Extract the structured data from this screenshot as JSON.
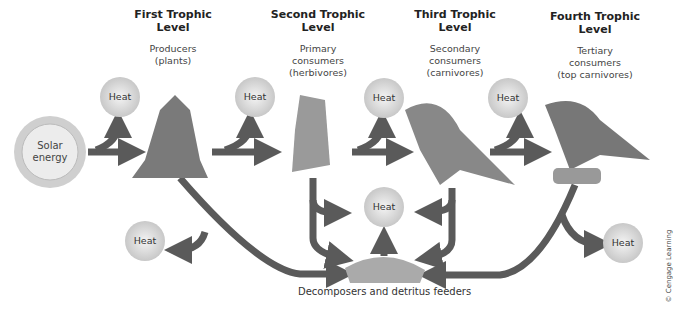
{
  "levels": [
    {
      "title1": "First Trophic",
      "title2": "Level",
      "sub1": "Producers",
      "sub2": "(plants)",
      "organism": "plants"
    },
    {
      "title1": "Second Trophic",
      "title2": "Level",
      "sub1": "Primary",
      "sub2": "consumers",
      "sub3": "(herbivores)",
      "organism": "caterpillar"
    },
    {
      "title1": "Third Trophic",
      "title2": "Level",
      "sub1": "Secondary",
      "sub2": "consumers",
      "sub3": "(carnivores)",
      "organism": "robin"
    },
    {
      "title1": "Fourth Trophic",
      "title2": "Level",
      "sub1": "Tertiary",
      "sub2": "consumers",
      "sub3": "(top carnivores)",
      "organism": "hawk"
    }
  ],
  "solar": {
    "line1": "Solar",
    "line2": "energy"
  },
  "heat_label": "Heat",
  "decomposers": "Decomposers and detritus feeders",
  "credit": "© Cengage Learning",
  "colors": {
    "arrow": "#5a5a5a",
    "heat_fill": "#d8d8d8",
    "sun_fill": "#e6e6e6"
  }
}
